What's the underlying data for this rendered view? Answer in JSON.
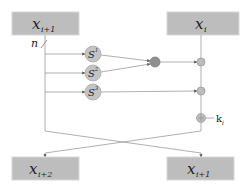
{
  "diagram": {
    "type": "feistel-round",
    "boxes": {
      "top_left": {
        "base": "x",
        "sub": "i+1"
      },
      "top_right": {
        "base": "x",
        "sub": "i"
      },
      "bottom_left": {
        "base": "x",
        "sub": "i+2"
      },
      "bottom_right": {
        "base": "x",
        "sub": "i+1"
      }
    },
    "width_label": {
      "text": "n",
      "slash": "/"
    },
    "sboxes": [
      {
        "base": "S",
        "sup": "1"
      },
      {
        "base": "S",
        "sup": "2"
      },
      {
        "base": "S",
        "sup": "3"
      }
    ],
    "key_label": {
      "base": "k",
      "sub": "i"
    }
  }
}
